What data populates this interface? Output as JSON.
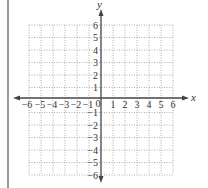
{
  "diagram": {
    "type": "coordinate-grid",
    "x_axis": {
      "label": "x",
      "min": -6,
      "max": 6,
      "ticks": [
        "−6",
        "−5",
        "−4",
        "−3",
        "−2",
        "−1",
        "1",
        "2",
        "3",
        "4",
        "5",
        "6"
      ]
    },
    "y_axis": {
      "label": "y",
      "min": -6,
      "max": 6,
      "ticks": [
        "6",
        "5",
        "4",
        "3",
        "2",
        "1",
        "−1",
        "−2",
        "−3",
        "−4",
        "−5",
        "−6"
      ]
    },
    "origin_label": "0",
    "grid": "dotted",
    "colors": {
      "axis": "#444444",
      "grid": "#9a9a9a",
      "margin_rule": "#9a9a9a"
    }
  }
}
